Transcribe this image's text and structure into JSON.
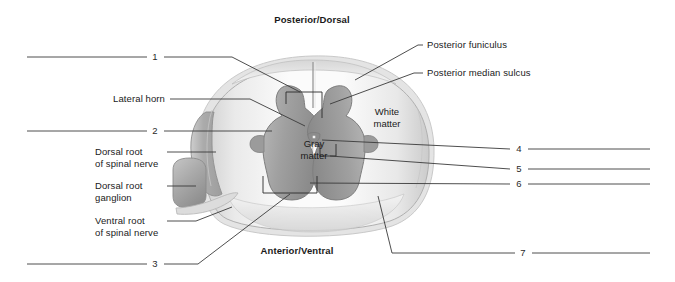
{
  "figure": {
    "title_top": "Posterior/Dorsal",
    "title_bottom": "Anterior/Ventral",
    "inner_labels": {
      "gray_matter": "Gray\nmatter",
      "white_matter": "White\nmatter"
    },
    "named_labels": [
      {
        "id": "lateral-horn",
        "text": "Lateral horn"
      },
      {
        "id": "dorsal-root-of-spinal-nerve",
        "text": "Dorsal root\nof spinal nerve"
      },
      {
        "id": "dorsal-root-ganglion",
        "text": "Dorsal root\nganglion"
      },
      {
        "id": "ventral-root-of-spinal-nerve",
        "text": "Ventral root\nof spinal nerve"
      },
      {
        "id": "posterior-funiculus",
        "text": "Posterior funiculus"
      },
      {
        "id": "posterior-median-sulcus",
        "text": "Posterior median sulcus"
      }
    ],
    "numbered_blanks": [
      {
        "id": "blank-1",
        "number": "1"
      },
      {
        "id": "blank-2",
        "number": "2"
      },
      {
        "id": "blank-3",
        "number": "3"
      },
      {
        "id": "blank-4",
        "number": "4"
      },
      {
        "id": "blank-5",
        "number": "5"
      },
      {
        "id": "blank-6",
        "number": "6"
      },
      {
        "id": "blank-7",
        "number": "7"
      }
    ],
    "colors": {
      "background": "#ffffff",
      "line": "#3a3a3a",
      "text": "#1a1a1a",
      "gray_matter": "#9a9a9a",
      "gray_matter_dark": "#808080",
      "white_matter": "#f2f2f2",
      "white_matter_shade": "#dcdcdc",
      "cord_outline": "#b8b8b8",
      "root_gray": "#b0b0b0",
      "ganglion_gray": "#a8a8a8"
    }
  }
}
